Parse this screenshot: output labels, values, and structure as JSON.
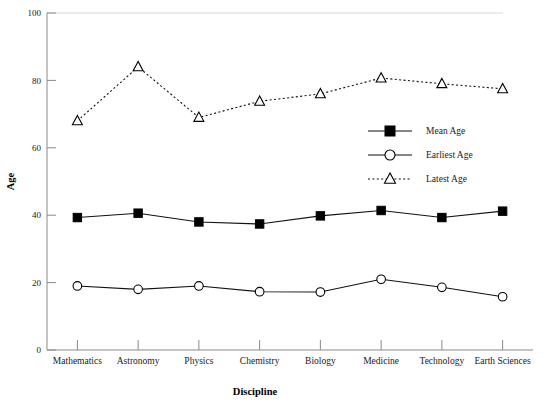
{
  "chart_data": {
    "type": "line",
    "title": "",
    "xlabel": "Discipline",
    "ylabel": "Age",
    "ylim": [
      0,
      100
    ],
    "yticks": [
      0,
      20,
      40,
      60,
      80,
      100
    ],
    "grid": false,
    "legend_position": "center-right",
    "categories": [
      "Mathematics",
      "Astronomy",
      "Physics",
      "Chemistry",
      "Biology",
      "Medicine",
      "Technology",
      "Earth Sciences"
    ],
    "series": [
      {
        "name": "Mean Age",
        "marker": "filled-square",
        "linestyle": "solid",
        "values": [
          39.3,
          40.6,
          38.0,
          37.4,
          39.8,
          41.4,
          39.3,
          41.2
        ]
      },
      {
        "name": "Earliest Age",
        "marker": "open-circle",
        "linestyle": "solid",
        "values": [
          19.0,
          18.0,
          19.0,
          17.3,
          17.2,
          21.0,
          18.6,
          15.8
        ]
      },
      {
        "name": "Latest Age",
        "marker": "open-triangle",
        "linestyle": "dotted",
        "values": [
          68.0,
          84.0,
          69.0,
          73.8,
          76.0,
          80.7,
          79.0,
          77.5
        ]
      }
    ],
    "colors": {
      "line": "#111111",
      "axis": "#8a8a8a",
      "text": "#1a1a1a",
      "background": "#ffffff"
    }
  }
}
